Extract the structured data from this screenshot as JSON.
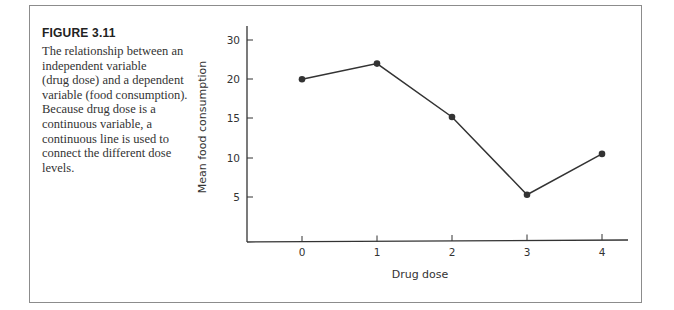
{
  "figure": {
    "label": "FIGURE 3.11",
    "caption_lines": [
      "The relationship between an",
      "independent variable",
      "(drug dose) and a dependent",
      "variable (food consumption).",
      "Because drug dose is a",
      "continuous variable, a",
      "continuous line is used to",
      "connect the different dose",
      "levels."
    ]
  },
  "chart_data": {
    "type": "line",
    "title": "",
    "xlabel": "Drug dose",
    "ylabel": "Mean food consumption",
    "x": [
      0,
      1,
      2,
      3,
      4
    ],
    "categories": [
      "0",
      "1",
      "2",
      "3",
      "4"
    ],
    "series": [
      {
        "name": "Mean food consumption",
        "values": [
          20,
          22,
          15.2,
          5.3,
          10.5
        ]
      }
    ],
    "y_tick_labels": [
      "5",
      "10",
      "15",
      "20",
      "30"
    ],
    "ylim": [
      0,
      30
    ],
    "grid": false,
    "legend": "none",
    "line_color": "#333333",
    "marker": "filled-circle"
  }
}
